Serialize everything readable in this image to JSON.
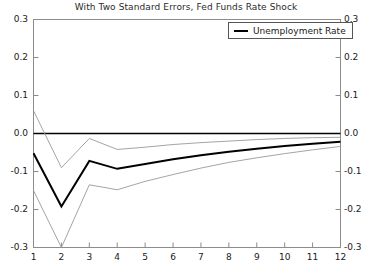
{
  "chart_data": {
    "type": "line",
    "title": "With Two Standard Errors, Fed Funds Rate Shock",
    "xlabel": "",
    "ylabel": "",
    "x": [
      1,
      2,
      3,
      4,
      5,
      6,
      7,
      8,
      9,
      10,
      11,
      12
    ],
    "xlim": [
      1,
      12
    ],
    "ylim": [
      -0.3,
      0.3
    ],
    "yticks": [
      0.3,
      0.2,
      0.1,
      0.0,
      -0.1,
      -0.2,
      -0.3
    ],
    "ytick_labels": [
      "0.3",
      "0.2",
      "0.1",
      "0.0",
      "-0.1",
      "-0.2",
      "-0.3"
    ],
    "xticks": [
      1,
      2,
      3,
      4,
      5,
      6,
      7,
      8,
      9,
      10,
      11,
      12
    ],
    "xtick_labels": [
      "1",
      "2",
      "3",
      "4",
      "5",
      "6",
      "7",
      "8",
      "9",
      "10",
      "11",
      "12"
    ],
    "grid": false,
    "zero_line": 0.0,
    "legend_position": "top-right",
    "series": [
      {
        "name": "Unemployment Rate",
        "style": "solid-thick",
        "color": "#000000",
        "values": [
          -0.052,
          -0.192,
          -0.072,
          -0.093,
          -0.08,
          -0.068,
          -0.057,
          -0.048,
          -0.04,
          -0.033,
          -0.027,
          -0.022
        ]
      },
      {
        "name": "Upper Two Standard Error Band",
        "style": "solid-thin",
        "color": "#9a9a9a",
        "values": [
          0.06,
          -0.09,
          -0.013,
          -0.042,
          -0.036,
          -0.029,
          -0.024,
          -0.02,
          -0.016,
          -0.013,
          -0.011,
          -0.01
        ]
      },
      {
        "name": "Lower Two Standard Error Band",
        "style": "solid-thin",
        "color": "#9a9a9a",
        "values": [
          -0.15,
          -0.3,
          -0.135,
          -0.148,
          -0.126,
          -0.108,
          -0.091,
          -0.076,
          -0.064,
          -0.053,
          -0.043,
          -0.034
        ]
      }
    ]
  },
  "legend": {
    "label": "Unemployment Rate"
  }
}
